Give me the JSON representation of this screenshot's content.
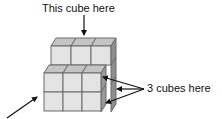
{
  "diagram": {
    "type": "isometric-cube-stack",
    "labels": {
      "top": "This cube here",
      "right": "3 cubes here"
    },
    "structure": {
      "back_block": {
        "rows": 1,
        "columns": 3,
        "description": "top layer of 3 cubes set back"
      },
      "front_block": {
        "rows": 2,
        "columns": 3,
        "description": "front block of 2x3 cubes"
      }
    },
    "arrows": [
      {
        "name": "top-arrow",
        "points_to": "top back cube",
        "label": "This cube here"
      },
      {
        "name": "right-arrow-1",
        "points_to": "hidden cube",
        "label": "3 cubes here"
      },
      {
        "name": "right-arrow-2",
        "points_to": "hidden cube",
        "label": "3 cubes here"
      },
      {
        "name": "right-arrow-3",
        "points_to": "hidden cube",
        "label": "3 cubes here"
      },
      {
        "name": "bottom-left-arrow",
        "points_to": "front block",
        "label": ""
      }
    ],
    "colors": {
      "front_face": "#e4e4e4",
      "top_face": "#c4c4c4",
      "side_face": "#8e8e8e",
      "edge": "#6a6a6a",
      "arrow": "#111111"
    }
  }
}
